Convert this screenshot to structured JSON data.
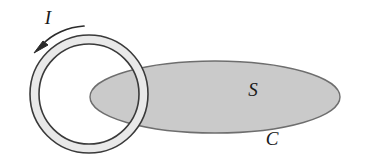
{
  "figure": {
    "background_color": "#ffffff",
    "width": 367,
    "height": 167
  },
  "labels": {
    "current": "I",
    "surface": "S",
    "curve": "C"
  },
  "colors": {
    "ring_fill": "#e9e9e9",
    "ring_stroke": "#3a3a3a",
    "surface_fill": "#cacaca",
    "surface_stroke": "#6e6e6e",
    "label_color": "#1a1a1a",
    "arrow_color": "#2b2b2b"
  },
  "geometry": {
    "ring": {
      "center_x": 89,
      "center_y": 94,
      "outer_radius": 59,
      "inner_radius": 50,
      "band_width": 9
    },
    "surface": {
      "center_x": 215,
      "center_y": 97,
      "radius_x": 125,
      "radius_y": 36
    },
    "current_arrow": {
      "direction": "counterclockwise",
      "arrowhead_x": 39,
      "arrowhead_y": 49
    },
    "label_positions": {
      "current": {
        "x": 48,
        "y": 24
      },
      "surface": {
        "x": 253,
        "y": 96
      },
      "curve": {
        "x": 272,
        "y": 145
      }
    }
  },
  "label_sizes": {
    "current": 19,
    "surface": 19,
    "curve": 19
  }
}
